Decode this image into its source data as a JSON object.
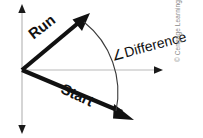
{
  "figure": {
    "background_color": "#ffffff",
    "width": 203,
    "height": 138
  },
  "colors": {
    "vector": "#111111",
    "axis": "#b9b9b9",
    "arc": "#3a3a3a",
    "copyright": "#8a8a8a",
    "label": "#111111"
  },
  "axes": {
    "vertical": {
      "name": "vertical-axis",
      "x": 22,
      "y_top": 6,
      "y_bottom": 132,
      "double_headed": true
    },
    "horizontal": {
      "name": "horizontal-axis",
      "y": 70,
      "x_start": 22,
      "x_end": 162,
      "double_headed": false
    }
  },
  "vectors": [
    {
      "id": "run",
      "label": "Run",
      "origin": [
        22,
        70
      ],
      "tip": [
        88,
        15
      ],
      "angle_deg": -38
    },
    {
      "id": "start",
      "label": "Start",
      "origin": [
        22,
        70
      ],
      "tip": [
        132,
        118
      ],
      "angle_deg": 25
    }
  ],
  "arc": {
    "label": "∠Difference",
    "from": [
      84,
      22
    ],
    "to": [
      118,
      110
    ],
    "radius": 88
  },
  "labels": {
    "run": "Run",
    "start": "Start",
    "difference": "∠Difference",
    "copyright": "© Cengage Learning 2013"
  }
}
